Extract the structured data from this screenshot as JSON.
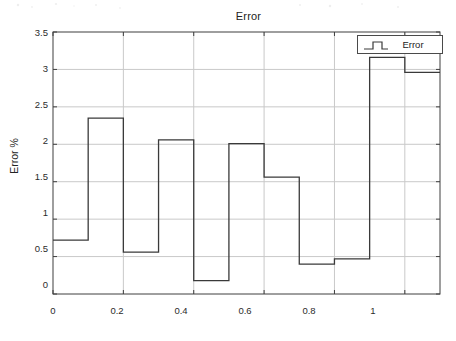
{
  "figure": {
    "background_color": "#ffffff",
    "axes_color": "#3f3f3f",
    "grid_color": "#c9c9c9",
    "line_color": "#3a3a3a"
  },
  "chart_data": {
    "type": "line",
    "drawstyle": "steps-post",
    "title": "Error",
    "xlabel": "",
    "ylabel": "Error %",
    "xlim": [
      0,
      1.1
    ],
    "ylim": [
      0,
      3.5
    ],
    "grid": true,
    "legend_position": "upper right",
    "xticks": [
      0,
      0.2,
      0.4,
      0.6,
      0.8,
      1
    ],
    "xtick_labels": [
      "0",
      "0.2",
      "0.4",
      "0.6",
      "0.8",
      "1"
    ],
    "yticks": [
      0,
      0.5,
      1,
      1.5,
      2,
      2.5,
      3,
      3.5
    ],
    "ytick_labels": [
      "0",
      "0.5",
      "1",
      "1.5",
      "2",
      "2.5",
      "3",
      "3.5"
    ],
    "series": [
      {
        "name": "Error",
        "x": [
          0,
          0.1,
          0.2,
          0.3,
          0.4,
          0.5,
          0.6,
          0.7,
          0.8,
          0.9,
          1.0,
          1.1
        ],
        "values": [
          0.72,
          2.35,
          0.56,
          2.06,
          0.18,
          2.01,
          1.56,
          0.4,
          0.47,
          3.16,
          2.96,
          2.96
        ]
      }
    ]
  },
  "legend": {
    "entries": [
      {
        "label": "Error",
        "marker": "step-line-icon"
      }
    ]
  }
}
